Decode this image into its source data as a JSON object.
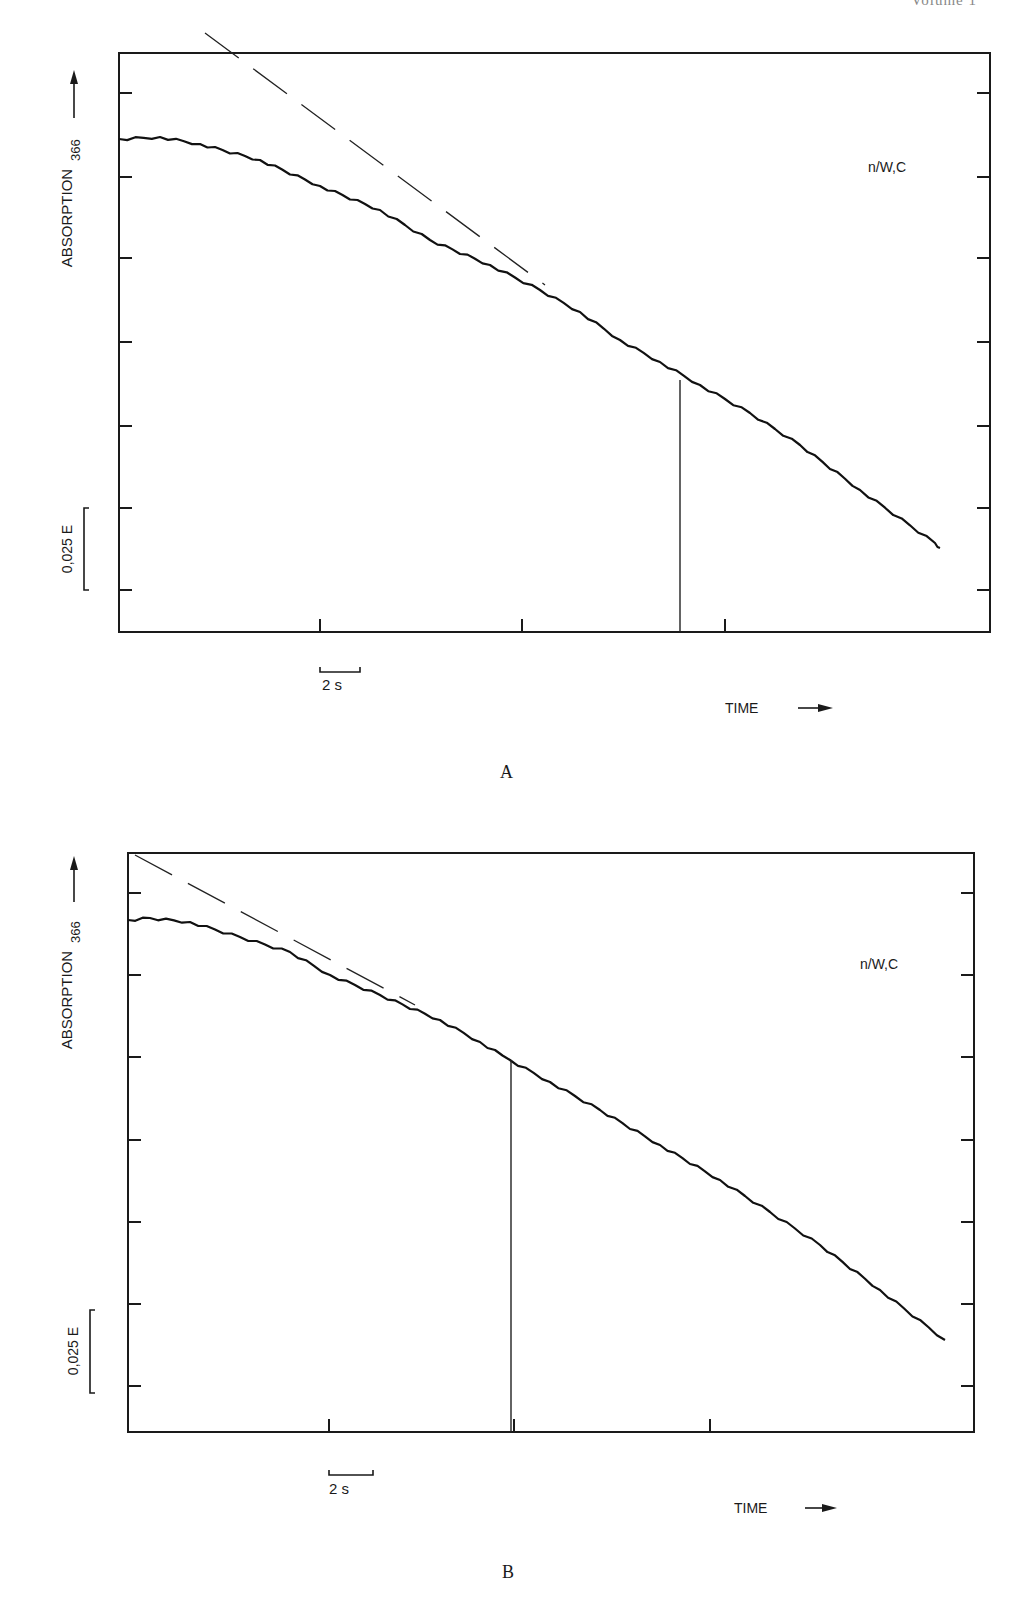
{
  "page": {
    "header_fragment": "Volume 1"
  },
  "chart_data": [
    {
      "panel": "A",
      "type": "line",
      "title": "",
      "annotation": "n/W,C",
      "xlabel": "TIME",
      "ylabel": "ABSORPTION",
      "ylabel_subscript": "366",
      "scale_bar_y": "0,025 E",
      "scale_bar_x": "2 s",
      "grid": false,
      "legend": "none",
      "y_tick_count": 7,
      "x_tick_count": 3,
      "series": [
        {
          "name": "absorption trace",
          "style": "solid",
          "x_s": [
            0,
            1.6,
            4.0,
            6.2,
            8.4,
            10.0,
            11.6,
            13.6,
            16.3
          ],
          "absorption_E_relative": [
            0.0,
            -0.0015,
            -0.013,
            -0.0295,
            -0.0445,
            -0.0595,
            -0.073,
            -0.091,
            -0.121
          ]
        },
        {
          "name": "extrapolated initial slope",
          "style": "dashed",
          "x_s": [
            1.7,
            8.5
          ],
          "absorption_E_relative": [
            0.032,
            -0.045
          ]
        }
      ],
      "vertical_marker_x_s": 11.2,
      "pixel_geometry": {
        "plot": {
          "left": 119,
          "right": 990,
          "top": 53,
          "bottom": 632
        },
        "y_ticks_px": [
          93,
          177,
          258,
          342,
          426,
          508,
          590
        ],
        "x_ticks_px": [
          320,
          522,
          725
        ],
        "trace_px": [
          [
            119,
            139
          ],
          [
            160,
            137
          ],
          [
            200,
            144
          ],
          [
            260,
            160
          ],
          [
            320,
            186
          ],
          [
            380,
            210
          ],
          [
            430,
            240
          ],
          [
            490,
            265
          ],
          [
            540,
            290
          ],
          [
            580,
            312
          ],
          [
            620,
            340
          ],
          [
            660,
            362
          ],
          [
            700,
            385
          ],
          [
            750,
            413
          ],
          [
            800,
            445
          ],
          [
            860,
            490
          ],
          [
            935,
            543
          ],
          [
            940,
            548
          ]
        ],
        "dashed_px": [
          [
            205,
            33
          ],
          [
            545,
            285
          ]
        ],
        "marker_px": {
          "x": 680,
          "y_top": 380,
          "y_bottom": 632
        },
        "scale_bar_y_px": {
          "x": 84,
          "y_top": 508,
          "y_bottom": 590
        },
        "scale_bar_x_px": {
          "x_left": 320,
          "x_right": 360,
          "y": 672
        }
      }
    },
    {
      "panel": "B",
      "type": "line",
      "title": "",
      "annotation": "n/W,C",
      "xlabel": "TIME",
      "ylabel": "ABSORPTION",
      "ylabel_subscript": "366",
      "scale_bar_y": "0,025 E",
      "scale_bar_x": "2 s",
      "grid": false,
      "legend": "none",
      "y_tick_count": 7,
      "x_tick_count": 3,
      "series": [
        {
          "name": "absorption trace",
          "style": "solid",
          "x_s": [
            0,
            2.4,
            4.4,
            6.8,
            8.3,
            10.3,
            12.9,
            15.1,
            17.8
          ],
          "absorption_E_relative": [
            0.0,
            -0.005,
            -0.0165,
            -0.03,
            -0.042,
            -0.057,
            -0.078,
            -0.098,
            -0.127
          ]
        },
        {
          "name": "extrapolated initial slope",
          "style": "dashed",
          "x_s": [
            0.15,
            6.2
          ],
          "absorption_E_relative": [
            0.02,
            -0.026
          ]
        }
      ],
      "vertical_marker_x_s": 8.3,
      "pixel_geometry": {
        "plot": {
          "left": 128,
          "right": 974,
          "top": 853,
          "bottom": 1432
        },
        "y_ticks_px": [
          893,
          975,
          1057,
          1140,
          1222,
          1304,
          1386
        ],
        "x_ticks_px": [
          329,
          514,
          710
        ],
        "trace_px": [
          [
            128,
            920
          ],
          [
            150,
            918
          ],
          [
            190,
            922
          ],
          [
            240,
            937
          ],
          [
            290,
            952
          ],
          [
            330,
            975
          ],
          [
            380,
            995
          ],
          [
            440,
            1020
          ],
          [
            480,
            1042
          ],
          [
            510,
            1060
          ],
          [
            550,
            1082
          ],
          [
            600,
            1110
          ],
          [
            660,
            1145
          ],
          [
            720,
            1180
          ],
          [
            770,
            1212
          ],
          [
            820,
            1245
          ],
          [
            880,
            1290
          ],
          [
            945,
            1340
          ]
        ],
        "dashed_px": [
          [
            135,
            855
          ],
          [
            415,
            1005
          ]
        ],
        "marker_px": {
          "x": 511,
          "y_top": 1060,
          "y_bottom": 1432
        },
        "scale_bar_y_px": {
          "x": 90,
          "y_top": 1310,
          "y_bottom": 1393
        },
        "scale_bar_x_px": {
          "x_left": 329,
          "x_right": 373,
          "y": 1475
        }
      }
    }
  ],
  "panels": {
    "A": {
      "letter": "A",
      "annotation": "n/W,C",
      "ylabel": "ABSORPTION",
      "ylabel_sub": "366",
      "scale_y": "0,025 E",
      "scale_x": "2 s",
      "xlabel": "TIME"
    },
    "B": {
      "letter": "B",
      "annotation": "n/W,C",
      "ylabel": "ABSORPTION",
      "ylabel_sub": "366",
      "scale_y": "0,025 E",
      "scale_x": "2 s",
      "xlabel": "TIME"
    }
  }
}
